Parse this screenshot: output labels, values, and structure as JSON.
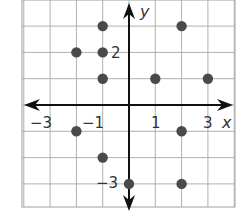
{
  "chart_data": {
    "type": "scatter",
    "title": "",
    "xlabel": "x",
    "ylabel": "y",
    "xlim": [
      -4,
      4
    ],
    "ylim": [
      -4,
      4
    ],
    "grid": true,
    "x_tick_labels": [
      "−3",
      "−1",
      "1",
      "3"
    ],
    "y_tick_labels": [
      "2",
      "−3"
    ],
    "points": [
      {
        "x": -1,
        "y": 3
      },
      {
        "x": 2,
        "y": 3
      },
      {
        "x": -2,
        "y": 2
      },
      {
        "x": -1,
        "y": 2
      },
      {
        "x": -1,
        "y": 1
      },
      {
        "x": 1,
        "y": 1
      },
      {
        "x": 3,
        "y": 1
      },
      {
        "x": -2,
        "y": -1
      },
      {
        "x": 2,
        "y": -1
      },
      {
        "x": -1,
        "y": -2
      },
      {
        "x": 0,
        "y": -3
      },
      {
        "x": 2,
        "y": -3
      }
    ],
    "point_color": "#4a4a4a",
    "grid_color": "#b0b0b0",
    "axis_color": "#111111"
  },
  "labels": {
    "x_axis": "x",
    "y_axis": "y",
    "tick_neg3_x": "−3",
    "tick_neg1_x": "−1",
    "tick_1_x": "1",
    "tick_3_x": "3",
    "tick_2_y": "2",
    "tick_neg3_y": "−3"
  }
}
